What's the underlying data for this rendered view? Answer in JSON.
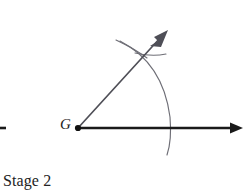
{
  "figure": {
    "caption": "Stage 2",
    "vertex_label": "G",
    "colors": {
      "baseline": "#1a1a1a",
      "ray": "#4f4f57",
      "arc": "#6e6e76",
      "text": "#232323",
      "background": "#ffffff"
    },
    "elements": {
      "baseline_ray": "horizontal-ray-with-arrowhead",
      "diagonal_ray": "diagonal-ray-with-arrowhead",
      "major_arc": "large-compass-arc",
      "minor_arc": "small-compass-arc",
      "vertex_dot": "vertex-point"
    }
  },
  "geometry": {
    "vertex": {
      "x": 78,
      "y": 128
    },
    "horizontal_ray": {
      "x1": 78,
      "y1": 128,
      "x2": 236,
      "y2": 128
    },
    "diagonal_ray": {
      "x1": 78,
      "y1": 128,
      "x2": 163,
      "y2": 35
    },
    "diagonal_angle_deg": 47,
    "major_arc": {
      "start_x": 120,
      "start_y": 42,
      "end_x": 167,
      "end_y": 155,
      "radius": 92
    },
    "minor_arc": {
      "start_x": 117,
      "start_y": 40,
      "end_x": 165,
      "end_y": 54,
      "radius": 62
    },
    "arrow_tip_horizontal": {
      "x": 243,
      "y": 128
    },
    "arrow_tip_diagonal": {
      "x": 168,
      "y": 30
    },
    "edge_fragment": {
      "x1": 0,
      "y1": 128,
      "x2": 6,
      "y2": 128
    }
  }
}
